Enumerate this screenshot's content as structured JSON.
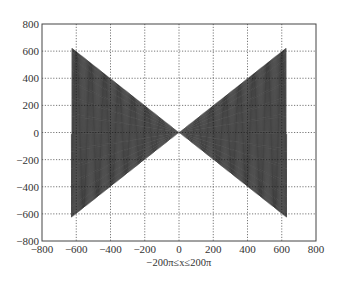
{
  "chart_data": {
    "type": "line",
    "title": "",
    "xlabel": "−200π≤x≤200π",
    "ylabel": "",
    "function": "y = x·sin(x)",
    "x_range": [
      -628.3,
      628.3
    ],
    "envelope": {
      "upper": "y = |x|",
      "lower": "y = -|x|",
      "max_abs": 628.3
    },
    "xlim": [
      -800,
      800
    ],
    "ylim": [
      -800,
      800
    ],
    "xticks": [
      -800,
      -600,
      -400,
      -200,
      0,
      200,
      400,
      600,
      800
    ],
    "yticks": [
      -800,
      -600,
      -400,
      -200,
      0,
      200,
      400,
      600,
      800
    ],
    "xtick_labels": [
      "−800",
      "−600",
      "−400",
      "−200",
      "0",
      "200",
      "400",
      "600",
      "800"
    ],
    "ytick_labels": [
      "−800",
      "−600",
      "−400",
      "−200",
      "0",
      "200",
      "400",
      "600",
      "800"
    ],
    "grid": true,
    "grid_style": "dotted",
    "legend": null,
    "line_color": "#111111"
  },
  "colors": {
    "background": "#ffffff",
    "line": "#111111",
    "grid": "#555555",
    "frame": "#444444"
  }
}
